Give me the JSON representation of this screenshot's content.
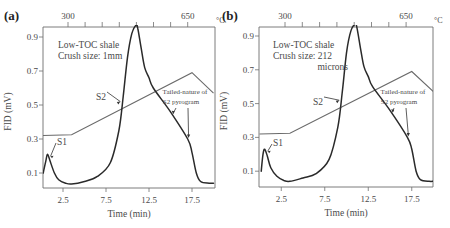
{
  "chart_data": [
    {
      "type": "line",
      "panel_label": "(a)",
      "annotation_lines": [
        "Low-TOC shale",
        "Crush size: 1mm"
      ],
      "xlabel": "Time (min)",
      "ylabel": "FID (mV)",
      "top_axis_label_unit": "°C",
      "top_axis_ticks": [
        "300",
        "650"
      ],
      "xticks": [
        "2.5",
        "7.5",
        "12.5",
        "17.5"
      ],
      "yticks": [
        "0.9",
        "0.7",
        "0.5",
        "0.3",
        "0.1"
      ],
      "xlim": [
        0,
        20
      ],
      "ylim": [
        0.02,
        0.97
      ],
      "peak_labels": [
        "S1",
        "S2"
      ],
      "tail_annotation": [
        "Tailed-nature of",
        "S2 pyrogram"
      ],
      "series": [
        {
          "name": "FID signal",
          "x": [
            0.2,
            0.5,
            0.7,
            1.0,
            1.5,
            2.0,
            2.8,
            3.5,
            5.0,
            6.5,
            8.0,
            9.0,
            9.5,
            10.0,
            10.5,
            11.0,
            11.2,
            11.6,
            12.0,
            12.5,
            13.0,
            15.0,
            17.0,
            17.5,
            18.0,
            18.5,
            19.5,
            20.0
          ],
          "y": [
            0.1,
            0.17,
            0.21,
            0.17,
            0.1,
            0.06,
            0.04,
            0.035,
            0.05,
            0.08,
            0.16,
            0.35,
            0.55,
            0.78,
            0.92,
            0.97,
            0.95,
            0.83,
            0.72,
            0.66,
            0.6,
            0.46,
            0.3,
            0.22,
            0.1,
            0.05,
            0.04,
            0.04
          ]
        },
        {
          "name": "Temperature",
          "x": [
            0,
            3.5,
            17.5,
            20
          ],
          "y": [
            0.32,
            0.325,
            0.69,
            0.57
          ]
        }
      ]
    },
    {
      "type": "line",
      "panel_label": "(b)",
      "annotation_lines": [
        "Low-TOC shale",
        "Crush size: 212",
        "microns"
      ],
      "xlabel": "Time (min)",
      "ylabel": "FID (mV)",
      "top_axis_label_unit": "°C",
      "top_axis_ticks": [
        "300",
        "650"
      ],
      "xticks": [
        "2.5",
        "7.5",
        "12.5",
        "17.5"
      ],
      "yticks": [
        "0.9",
        "0.7",
        "0.5",
        "0.3",
        "0.1"
      ],
      "xlim": [
        0,
        20
      ],
      "ylim": [
        0.02,
        0.97
      ],
      "peak_labels": [
        "S1",
        "S2"
      ],
      "tail_annotation": [
        "Tailed-nature of",
        "S2 pyrogram"
      ],
      "series": [
        {
          "name": "FID signal",
          "x": [
            0.2,
            0.4,
            0.6,
            0.9,
            1.3,
            2.0,
            2.8,
            3.5,
            5.0,
            6.5,
            8.0,
            9.0,
            9.5,
            10.0,
            10.5,
            11.0,
            11.2,
            11.6,
            12.0,
            12.5,
            13.0,
            15.0,
            17.0,
            17.5,
            18.0,
            18.5,
            19.5,
            20.0
          ],
          "y": [
            0.1,
            0.2,
            0.23,
            0.19,
            0.12,
            0.07,
            0.045,
            0.04,
            0.06,
            0.085,
            0.17,
            0.36,
            0.56,
            0.8,
            0.93,
            0.97,
            0.95,
            0.83,
            0.72,
            0.66,
            0.6,
            0.46,
            0.3,
            0.23,
            0.1,
            0.05,
            0.04,
            0.04
          ]
        },
        {
          "name": "Temperature",
          "x": [
            0,
            3.5,
            17.5,
            20
          ],
          "y": [
            0.32,
            0.325,
            0.69,
            0.57
          ]
        }
      ]
    }
  ]
}
